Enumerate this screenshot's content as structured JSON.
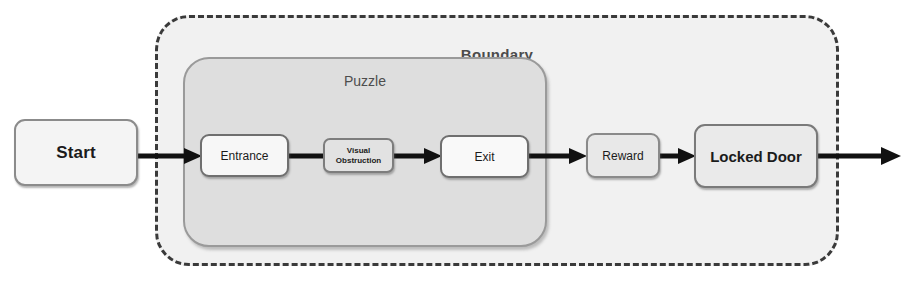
{
  "diagram": {
    "containers": [
      {
        "id": "boundary",
        "label": "Boundary",
        "style": "dashed-rounded",
        "fill": "#f1f1f1",
        "stroke": "#3a3a3a"
      },
      {
        "id": "puzzle",
        "label": "Puzzle",
        "style": "solid-rounded",
        "fill": "#dedede",
        "stroke": "#9a9a9a"
      }
    ],
    "nodes": [
      {
        "id": "start",
        "label": "Start",
        "label_line2": "",
        "fill": "#f4f4f4"
      },
      {
        "id": "entrance",
        "label": "Entrance",
        "label_line2": "",
        "fill": "#f7f7f7"
      },
      {
        "id": "obstruction",
        "label": "Visual",
        "label_line2": "Obstruction",
        "fill": "#e2e2e2"
      },
      {
        "id": "exit",
        "label": "Exit",
        "label_line2": "",
        "fill": "#f9f9f9"
      },
      {
        "id": "reward",
        "label": "Reward",
        "label_line2": "",
        "fill": "#e8e8e8"
      },
      {
        "id": "locked_door",
        "label": "Locked Door",
        "label_line2": "",
        "fill": "#eaeaea"
      }
    ],
    "edges": [
      {
        "id": "e1",
        "from": "start",
        "to": "entrance",
        "arrow": "filled-triangle"
      },
      {
        "id": "e2",
        "from": "entrance",
        "to": "obstruction",
        "arrow": "none"
      },
      {
        "id": "e3",
        "from": "obstruction",
        "to": "exit",
        "arrow": "filled-triangle"
      },
      {
        "id": "e4",
        "from": "exit",
        "to": "reward",
        "arrow": "filled-triangle"
      },
      {
        "id": "e5",
        "from": "reward",
        "to": "locked_door",
        "arrow": "filled-triangle"
      },
      {
        "id": "e6",
        "from": "locked_door",
        "to": "outside",
        "arrow": "filled-triangle"
      }
    ],
    "colors": {
      "background": "#ffffff",
      "edge": "#111111",
      "text": "#1b1b1b",
      "container_label": "#4b4b4b"
    }
  }
}
